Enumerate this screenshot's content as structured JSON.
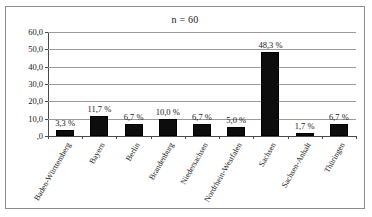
{
  "chart": {
    "title": "n = 60"
  },
  "chart_data": {
    "type": "bar",
    "title": "n = 60",
    "xlabel": "",
    "ylabel": "",
    "ylim": [
      0,
      60
    ],
    "grid": true,
    "legend": "none",
    "categories": [
      "Baden-Württemberg",
      "Bayern",
      "Berlin",
      "Brandenburg",
      "Niedersachsen",
      "Nordrhein-Westfalen",
      "Sachsen",
      "Sachsen-Anhalt",
      "Thüringen"
    ],
    "values": [
      3.3,
      11.7,
      6.7,
      10.0,
      6.7,
      5.0,
      48.3,
      1.7,
      6.7
    ],
    "value_labels": [
      "3,3 %",
      "11,7 %",
      "6,7 %",
      "10,0 %",
      "6,7 %",
      "5,0 %",
      "48,3 %",
      "1,7 %",
      "6,7 %"
    ],
    "ytick_values": [
      60,
      50,
      40,
      30,
      20,
      10,
      0
    ],
    "ytick_labels": [
      "60,0",
      "50,0",
      "40,0",
      "30,0",
      "20,0",
      "10,0",
      ",0"
    ],
    "bar_color": "#0d0d0d",
    "gridline_color": "#9a9a9a",
    "axis_color": "#4a4a4a",
    "frame_color": "#8c8c8c",
    "background_color": "#ffffff"
  }
}
